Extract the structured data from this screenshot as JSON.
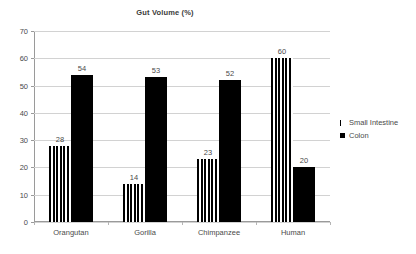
{
  "chart_data": {
    "type": "bar",
    "title": "Gut Volume (%)",
    "xlabel": "",
    "ylabel": "",
    "ylim": [
      0,
      70
    ],
    "ytick_step": 10,
    "yticks": [
      "0",
      "10",
      "20",
      "30",
      "40",
      "50",
      "60",
      "70"
    ],
    "grid": true,
    "legend_position": "right",
    "categories": [
      "Orangutan",
      "Gorilla",
      "Chimpanzee",
      "Human"
    ],
    "series": [
      {
        "name": "Small Intestine",
        "pattern": "vertical-stripes",
        "color": "#000000",
        "values": [
          28,
          14,
          23,
          60
        ],
        "labels": [
          "28",
          "14",
          "23",
          "60"
        ]
      },
      {
        "name": "Colon",
        "pattern": "solid",
        "color": "#000000",
        "values": [
          54,
          53,
          52,
          20
        ],
        "labels": [
          "54",
          "53",
          "52",
          "20"
        ]
      }
    ]
  },
  "legend": {
    "items": [
      {
        "label": "Small Intestine",
        "marker": "striped-bar-icon"
      },
      {
        "label": "Colon",
        "marker": "solid-square-icon"
      }
    ]
  },
  "colors": {
    "axis": "#9a9a9a",
    "grid": "#d2d2d2",
    "text": "#4a4a4a",
    "bar": "#000000",
    "background": "#ffffff"
  }
}
